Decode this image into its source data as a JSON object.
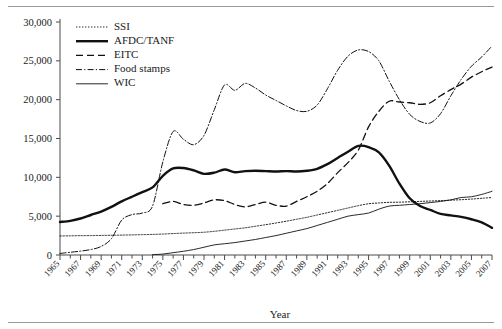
{
  "chart_data": {
    "type": "line",
    "title": "",
    "xlabel": "Year",
    "ylabel": "",
    "xlim": [
      1965,
      2007
    ],
    "ylim": [
      0,
      30000
    ],
    "grid": false,
    "legend_position": "top-left",
    "ytick_labels": [
      "0",
      "5,000",
      "10,000",
      "15,000",
      "20,000",
      "25,000",
      "30,000"
    ],
    "ytick_values": [
      0,
      5000,
      10000,
      15000,
      20000,
      25000,
      30000
    ],
    "xtick_labels": [
      "1965",
      "1967",
      "1969",
      "1971",
      "1973",
      "1975",
      "1977",
      "1979",
      "1981",
      "1983",
      "1985",
      "1987",
      "1989",
      "1991",
      "1993",
      "1995",
      "1997",
      "1999",
      "2001",
      "2003",
      "2005",
      "2007"
    ],
    "xtick_values": [
      1965,
      1967,
      1969,
      1971,
      1973,
      1975,
      1977,
      1979,
      1981,
      1983,
      1985,
      1987,
      1989,
      1991,
      1993,
      1995,
      1997,
      1999,
      2001,
      2003,
      2005,
      2007
    ],
    "x": [
      1965,
      1966,
      1967,
      1968,
      1969,
      1970,
      1971,
      1972,
      1973,
      1974,
      1975,
      1976,
      1977,
      1978,
      1979,
      1980,
      1981,
      1982,
      1983,
      1984,
      1985,
      1986,
      1987,
      1988,
      1989,
      1990,
      1991,
      1992,
      1993,
      1994,
      1995,
      1996,
      1997,
      1998,
      1999,
      2000,
      2001,
      2002,
      2003,
      2004,
      2005,
      2006,
      2007
    ],
    "series": [
      {
        "name": "SSI",
        "style": "dotted",
        "values": [
          2450,
          2470,
          2490,
          2500,
          2520,
          2540,
          2560,
          2590,
          2620,
          2650,
          2700,
          2760,
          2820,
          2870,
          2930,
          3050,
          3200,
          3350,
          3500,
          3700,
          3900,
          4120,
          4350,
          4600,
          4850,
          5150,
          5450,
          5750,
          6050,
          6350,
          6600,
          6700,
          6780,
          6800,
          6850,
          6900,
          6950,
          7000,
          7060,
          7120,
          7200,
          7300,
          7400
        ]
      },
      {
        "name": "AFDC/TANF",
        "style": "solid-thick",
        "values": [
          4250,
          4400,
          4700,
          5150,
          5600,
          6200,
          6900,
          7500,
          8100,
          8700,
          10200,
          11150,
          11200,
          10900,
          10450,
          10600,
          11000,
          10650,
          10800,
          10850,
          10800,
          10750,
          10800,
          10750,
          10850,
          11100,
          11700,
          12500,
          13300,
          14050,
          13900,
          13200,
          11500,
          9200,
          7300,
          6300,
          5800,
          5300,
          5100,
          4900,
          4600,
          4200,
          3500
        ]
      },
      {
        "name": "EITC",
        "style": "dashed",
        "values": [
          null,
          null,
          null,
          null,
          null,
          null,
          null,
          null,
          null,
          null,
          6600,
          6900,
          6500,
          6400,
          6700,
          7100,
          7000,
          6500,
          6200,
          6500,
          6800,
          6400,
          6300,
          6900,
          7500,
          8200,
          9200,
          10600,
          11900,
          13500,
          16500,
          18500,
          19800,
          19700,
          19600,
          19400,
          19600,
          20500,
          21300,
          22000,
          22900,
          23600,
          24200
        ]
      },
      {
        "name": "Food stamps",
        "style": "dash-dot",
        "values": [
          200,
          350,
          500,
          700,
          1100,
          2100,
          4500,
          5200,
          5400,
          6300,
          12000,
          15900,
          14900,
          14200,
          15400,
          18700,
          21900,
          21200,
          22100,
          21500,
          20600,
          19900,
          19200,
          18600,
          18500,
          19300,
          21400,
          23800,
          25600,
          26400,
          26200,
          25000,
          22400,
          20000,
          18100,
          17200,
          17000,
          18200,
          20500,
          22600,
          24300,
          25500,
          26900
        ]
      },
      {
        "name": "WIC",
        "style": "solid-thin",
        "values": [
          null,
          null,
          null,
          null,
          null,
          null,
          null,
          null,
          null,
          50,
          120,
          300,
          480,
          700,
          1000,
          1300,
          1450,
          1600,
          1800,
          2000,
          2250,
          2500,
          2800,
          3100,
          3400,
          3800,
          4200,
          4600,
          5000,
          5200,
          5400,
          5900,
          6300,
          6400,
          6500,
          6600,
          6750,
          6900,
          7100,
          7400,
          7500,
          7800,
          8200
        ]
      }
    ]
  },
  "legend": {
    "items": [
      {
        "label": "SSI",
        "style": "dotted"
      },
      {
        "label": "AFDC/TANF",
        "style": "solid-thick"
      },
      {
        "label": "EITC",
        "style": "dashed"
      },
      {
        "label": "Food stamps",
        "style": "dash-dot"
      },
      {
        "label": "WIC",
        "style": "solid-thin"
      }
    ]
  },
  "colors": {
    "line": "#111111",
    "axis": "#4a4a4a",
    "rule": "#999999",
    "background": "#ffffff"
  }
}
